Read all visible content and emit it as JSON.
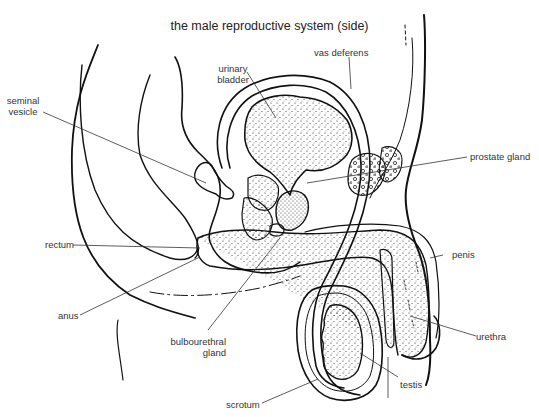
{
  "title": "the male reproductive system (side)",
  "labels": {
    "seminal_vesicle": [
      "seminal",
      "vesicle"
    ],
    "urinary_bladder": [
      "urinary",
      "bladder"
    ],
    "vas_deferens": "vas deferens",
    "prostate_gland": "prostate gland",
    "rectum": "rectum",
    "penis": "penis",
    "anus": "anus",
    "bulbourethral_gland": [
      "bulbourethral",
      "gland"
    ],
    "urethra": "urethra",
    "testis": "testis",
    "scrotum": "scrotum"
  },
  "colors": {
    "ink": "#111111",
    "leader": "#333333",
    "background": "#ffffff"
  }
}
